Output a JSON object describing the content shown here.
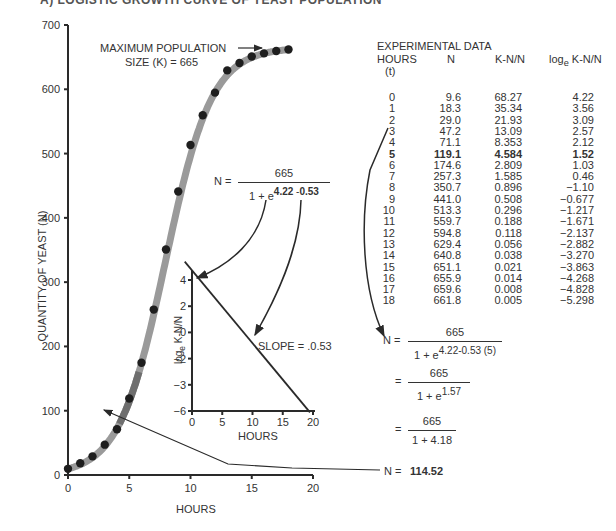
{
  "header": {
    "cut_title": "A) LOGISTIC GROWTH CURVE OF YEAST POPULATION"
  },
  "chart_data": [
    {
      "type": "scatter",
      "title": "",
      "xlabel": "HOURS",
      "ylabel": "QUANTITY OF YEAST (N)",
      "xlim": [
        0,
        20
      ],
      "ylim": [
        0,
        700
      ],
      "xticks": [
        "0",
        "5",
        "10",
        "15",
        "20"
      ],
      "yticks": [
        "0",
        "100",
        "200",
        "300",
        "400",
        "500",
        "600",
        "700"
      ],
      "series": [
        {
          "name": "Observed yeast quantity",
          "x": [
            0,
            1,
            2,
            3,
            4,
            5,
            6,
            7,
            8,
            9,
            10,
            11,
            12,
            13,
            14,
            15,
            16,
            17,
            18
          ],
          "y": [
            9.6,
            18.3,
            29.0,
            47.2,
            71.1,
            119.1,
            174.6,
            257.3,
            350.7,
            441.0,
            513.3,
            559.7,
            594.8,
            629.4,
            640.8,
            651.1,
            655.9,
            659.6,
            661.8
          ]
        },
        {
          "name": "Logistic fit curve",
          "K": 665,
          "a": 4.22,
          "r": 0.53
        }
      ],
      "annotations": [
        {
          "text_line1": "MAXIMUM POPULATION",
          "text_line2": "SIZE (K) = 665"
        }
      ],
      "grid": false
    },
    {
      "type": "line",
      "title": "",
      "xlabel": "HOURS",
      "ylabel": "loge K-N/N",
      "xlim": [
        0,
        20
      ],
      "ylim": [
        -6,
        4
      ],
      "xticks": [
        "0",
        "5",
        "10",
        "15",
        "20"
      ],
      "yticks": [
        "4",
        "2",
        "0",
        "-2",
        "-3",
        "-6"
      ],
      "series": [
        {
          "name": "Linearized fit",
          "x": [
            0,
            19.5
          ],
          "y": [
            4.22,
            -6.1
          ]
        }
      ],
      "annotations": [
        {
          "text": "SLOPE = .0.53"
        }
      ],
      "grid": false
    }
  ],
  "table": {
    "title": "EXPERIMENTAL DATA",
    "headers": [
      "HOURS",
      "N",
      "K-N/N",
      "log"
    ],
    "header_log_sub": "e",
    "header_log_rest": " K-N/N",
    "subheader": "(t)",
    "highlight_row": 5,
    "rows": [
      [
        "0",
        "9.6",
        "68.27",
        "4.22"
      ],
      [
        "1",
        "18.3",
        "35.34",
        "3.56"
      ],
      [
        "2",
        "29.0",
        "21.93",
        "3.09"
      ],
      [
        "3",
        "47.2",
        "13.09",
        "2.57"
      ],
      [
        "4",
        "71.1",
        "8.353",
        "2.12"
      ],
      [
        "5",
        "119.1",
        "4.584",
        "1.52"
      ],
      [
        "6",
        "174.6",
        "2.809",
        "1.03"
      ],
      [
        "7",
        "257.3",
        "1.585",
        "0.46"
      ],
      [
        "8",
        "350.7",
        "0.896",
        "−1.10"
      ],
      [
        "9",
        "441.0",
        "0.508",
        "−0.677"
      ],
      [
        "10",
        "513.3",
        "0.296",
        "−1.217"
      ],
      [
        "11",
        "559.7",
        "0.188",
        "−1.671"
      ],
      [
        "12",
        "594.8",
        "0.118",
        "−2.137"
      ],
      [
        "13",
        "629.4",
        "0.056",
        "−2.882"
      ],
      [
        "14",
        "640.8",
        "0.038",
        "−3.270"
      ],
      [
        "15",
        "651.1",
        "0.021",
        "−3.863"
      ],
      [
        "16",
        "655.9",
        "0.014",
        "−4.268"
      ],
      [
        "17",
        "659.6",
        "0.008",
        "−4.828"
      ],
      [
        "18",
        "661.8",
        "0.005",
        "−5.298"
      ]
    ]
  },
  "formulas": {
    "general": {
      "lhs": "N =",
      "num": "665",
      "den_base": "1 + e",
      "exp_a": "4.22",
      "exp_sep": " -",
      "exp_b": "0.53"
    },
    "step1": {
      "lhs": "N =",
      "num": "665",
      "den_base": "1 + e",
      "exp": "4.22-0.53 (5)"
    },
    "step2": {
      "lhs": "=",
      "num": "665",
      "den_base": "1 + e",
      "exp": "1.57"
    },
    "step3": {
      "lhs": "=",
      "num": "665",
      "den": "1 + 4.18"
    },
    "result": {
      "lhs": "N =",
      "value": "114.52"
    }
  },
  "colors": {
    "curve": "#9a9a9a",
    "curve_dark": "#6e6e6e",
    "point": "#1e1e1e",
    "axis": "#2a2a2a"
  }
}
